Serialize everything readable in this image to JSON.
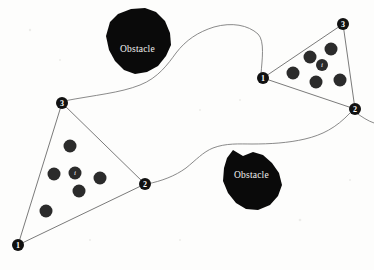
{
  "figure": {
    "title": "",
    "background_color": "#fdfdfc",
    "obstacle_color": "#0a0a0a",
    "edge_color": "#6b6b6b",
    "path_color": "#7d7d7d",
    "node_color": "#111111",
    "agent_color": "#2b2b2b",
    "label_color": "#f2f2f0"
  },
  "obstacles": [
    {
      "id": "obstacle-top-left",
      "label": "Obstacle",
      "label_x": 120,
      "label_y": 52,
      "points": "110,22 118,14 131,9 145,8 156,12 165,21 170,33 171,45 166,56 158,66 147,72 135,74 124,70 115,61 109,50 106,36"
    },
    {
      "id": "obstacle-bottom-right",
      "label": "Obstacle",
      "label_x": 234,
      "label_y": 178,
      "points": "224,168 227,158 233,150 243,156 253,152 263,155 272,163 279,173 282,185 278,196 270,205 258,210 246,209 236,203 228,193 223,181"
    }
  ],
  "triangles": [
    {
      "id": "triangle-left",
      "nodes": [
        {
          "id": "left-node-1",
          "label": "1",
          "x": 18,
          "y": 245
        },
        {
          "id": "left-node-2",
          "label": "2",
          "x": 145,
          "y": 184
        },
        {
          "id": "left-node-3",
          "label": "3",
          "x": 62,
          "y": 103
        }
      ],
      "agents": [
        {
          "id": "left-agent-a",
          "x": 70,
          "y": 146,
          "r": 6.5,
          "label": ""
        },
        {
          "id": "left-agent-b",
          "x": 54,
          "y": 174,
          "r": 6.5,
          "label": ""
        },
        {
          "id": "left-agent-i",
          "x": 75,
          "y": 173,
          "r": 6.5,
          "label": "i"
        },
        {
          "id": "left-agent-d",
          "x": 100,
          "y": 178,
          "r": 6.5,
          "label": ""
        },
        {
          "id": "left-agent-e",
          "x": 79,
          "y": 191,
          "r": 6.5,
          "label": ""
        },
        {
          "id": "left-agent-f",
          "x": 46,
          "y": 211,
          "r": 6.5,
          "label": ""
        }
      ]
    },
    {
      "id": "triangle-right",
      "nodes": [
        {
          "id": "right-node-1",
          "label": "1",
          "x": 263,
          "y": 78
        },
        {
          "id": "right-node-2",
          "label": "2",
          "x": 355,
          "y": 109
        },
        {
          "id": "right-node-3",
          "label": "3",
          "x": 343,
          "y": 24
        }
      ],
      "agents": [
        {
          "id": "right-agent-a",
          "x": 310,
          "y": 57,
          "r": 6.5,
          "label": ""
        },
        {
          "id": "right-agent-b",
          "x": 331,
          "y": 49,
          "r": 6.5,
          "label": ""
        },
        {
          "id": "right-agent-i",
          "x": 322,
          "y": 65,
          "r": 6.0,
          "label": "i"
        },
        {
          "id": "right-agent-d",
          "x": 293,
          "y": 73,
          "r": 6.5,
          "label": ""
        },
        {
          "id": "right-agent-e",
          "x": 316,
          "y": 82,
          "r": 6.5,
          "label": ""
        },
        {
          "id": "right-agent-f",
          "x": 340,
          "y": 80,
          "r": 6.5,
          "label": ""
        }
      ]
    }
  ],
  "paths": [
    {
      "id": "path-left-to-right",
      "description": "winding corridor from left triangle node 3 across to right triangle node 1",
      "d": "M 64,101 C 95,95 120,93 140,85 C 158,78 168,64 176,53 C 186,40 198,32 214,27 C 232,22 248,25 258,34 C 265,41 262,60 261,74"
    },
    {
      "id": "path-node2-to-node1",
      "description": "winding corridor from left triangle node 2 to right triangle node 1 skirting bottom obstacle",
      "d": "M 147,184 C 162,181 175,176 186,168 C 196,160 203,152 213,148 C 226,143 239,144 252,144 C 270,144 288,143 305,139 C 322,135 336,128 350,113"
    },
    {
      "id": "path-tail-right",
      "description": "curve segment continuing right of node 2 of right triangle",
      "d": "M 355,112 C 362,117 368,121 374,123"
    }
  ],
  "specks": [
    {
      "x": 30,
      "y": 30,
      "r": 1.2
    },
    {
      "x": 200,
      "y": 110,
      "r": 1.0
    },
    {
      "x": 90,
      "y": 240,
      "r": 1.1
    },
    {
      "x": 300,
      "y": 220,
      "r": 1.3
    },
    {
      "x": 180,
      "y": 240,
      "r": 1.0
    },
    {
      "x": 350,
      "y": 180,
      "r": 1.1
    },
    {
      "x": 60,
      "y": 60,
      "r": 1.0
    },
    {
      "x": 240,
      "y": 100,
      "r": 1.0
    }
  ]
}
